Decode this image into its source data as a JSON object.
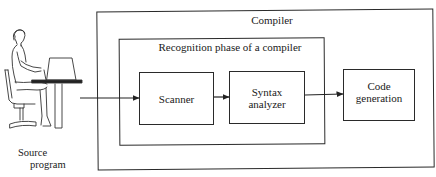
{
  "diagram": {
    "outer_box": {
      "title": "Compiler"
    },
    "inner_box": {
      "title": "Recognition phase of a compiler"
    },
    "components": [
      {
        "id": "scanner",
        "lines": [
          "Scanner"
        ]
      },
      {
        "id": "syntax-analyzer",
        "lines": [
          "Syntax",
          "analyzer"
        ]
      },
      {
        "id": "code-generation",
        "lines": [
          "Code",
          "generation"
        ]
      }
    ],
    "source": {
      "lines": [
        "Source",
        "program"
      ],
      "icon": "person-at-terminal-icon"
    },
    "edges": [
      {
        "from": "source",
        "to": "scanner"
      },
      {
        "from": "scanner",
        "to": "syntax-analyzer"
      },
      {
        "from": "syntax-analyzer",
        "to": "code-generation"
      }
    ],
    "colors": {
      "stroke": "#2a2a2a",
      "background": "#ffffff"
    }
  }
}
